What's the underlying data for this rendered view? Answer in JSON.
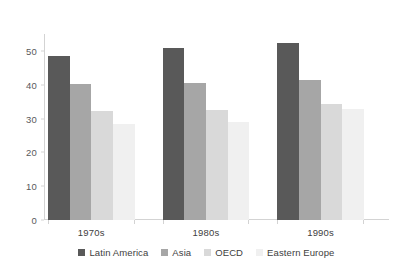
{
  "chart_data": {
    "type": "bar",
    "title": "",
    "subtitle": "",
    "xlabel": "",
    "ylabel": "",
    "categories": [
      "1970s",
      "1980s",
      "1990s"
    ],
    "series": [
      {
        "name": "Latin America",
        "color": "#595959",
        "values": [
          48.6,
          50.8,
          52.3
        ]
      },
      {
        "name": "Asia",
        "color": "#a6a6a6",
        "values": [
          40.2,
          40.4,
          41.3
        ]
      },
      {
        "name": "OECD",
        "color": "#d9d9d9",
        "values": [
          32.2,
          32.4,
          34.2
        ]
      },
      {
        "name": "Eastern Europe",
        "color": "#f0f0f0",
        "values": [
          28.5,
          29.1,
          32.9
        ]
      }
    ],
    "ylim": [
      0,
      55
    ],
    "yticks": [
      0,
      10,
      20,
      30,
      40,
      50
    ],
    "ytick_labels": [
      "0",
      "10",
      "20",
      "30",
      "40",
      "50"
    ],
    "grid": false,
    "legend_position": "bottom",
    "axis_color": "#d3d3d3",
    "text_color": "#404040",
    "background": "#ffffff"
  }
}
